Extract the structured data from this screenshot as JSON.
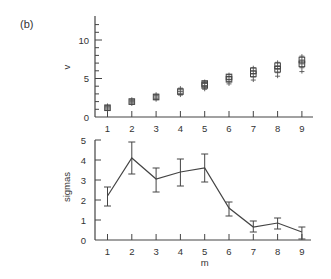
{
  "panel_label": "(b)",
  "chart_data": [
    {
      "type": "scatter",
      "title": "",
      "xlabel": "",
      "ylabel": "v",
      "x": [
        1,
        2,
        3,
        4,
        5,
        6,
        7,
        8,
        9
      ],
      "xticks": [
        "1",
        "2",
        "3",
        "4",
        "5",
        "6",
        "7",
        "8",
        "9"
      ],
      "yticks": [
        "0",
        "5",
        "10"
      ],
      "ylim": [
        0,
        13
      ],
      "grid": false,
      "series": [
        {
          "name": "v (multiple overlapping markers: squares and plus signs)",
          "values": [
            1.2,
            2.0,
            2.6,
            3.3,
            4.1,
            4.9,
            5.6,
            6.2,
            6.9
          ],
          "spread": [
            0.3,
            0.3,
            0.35,
            0.45,
            0.5,
            0.6,
            0.8,
            0.9,
            1.0
          ]
        }
      ]
    },
    {
      "type": "line",
      "title": "",
      "xlabel": "m",
      "ylabel": "sigmas",
      "x": [
        1,
        2,
        3,
        4,
        5,
        6,
        7,
        8,
        9
      ],
      "xticks": [
        "1",
        "2",
        "3",
        "4",
        "5",
        "6",
        "7",
        "8",
        "9"
      ],
      "yticks": [
        "0",
        "1",
        "2",
        "3",
        "4",
        "5"
      ],
      "ylim": [
        0,
        5
      ],
      "grid": false,
      "series": [
        {
          "name": "sigmas",
          "values": [
            2.2,
            4.1,
            3.05,
            3.4,
            3.6,
            1.6,
            0.65,
            0.85,
            0.4
          ],
          "err_low": [
            1.7,
            3.3,
            2.4,
            2.7,
            2.9,
            1.2,
            0.4,
            0.55,
            0.05
          ],
          "err_high": [
            2.65,
            4.9,
            3.6,
            4.05,
            4.3,
            1.9,
            0.95,
            1.1,
            0.65
          ]
        }
      ]
    }
  ]
}
